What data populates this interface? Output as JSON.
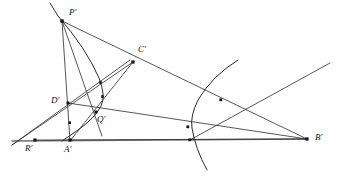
{
  "figure": {
    "canvas": {
      "width": 337,
      "height": 182
    },
    "colors": {
      "background": "#ffffff",
      "line": "#2b2b2b",
      "baseline": "#6e6e6e",
      "point": "#141414",
      "label": "#141414"
    }
  },
  "points": [
    {
      "id": "P",
      "label": "P′",
      "x": 62,
      "y": 21,
      "label_x": 69,
      "label_y": 8,
      "kind": "vertex"
    },
    {
      "id": "C",
      "label": "C′",
      "x": 133,
      "y": 62,
      "label_x": 138,
      "label_y": 45,
      "kind": "vertex"
    },
    {
      "id": "D",
      "label": "D′",
      "x": 68,
      "y": 103,
      "label_x": 51,
      "label_y": 96,
      "kind": "vertex"
    },
    {
      "id": "Q",
      "label": "Q′",
      "x": 96,
      "y": 112,
      "label_x": 97,
      "label_y": 115,
      "kind": "vertex"
    },
    {
      "id": "R",
      "label": "R′",
      "x": 35,
      "y": 140,
      "label_x": 25,
      "label_y": 144,
      "kind": "vertex"
    },
    {
      "id": "A",
      "label": "A′",
      "x": 70,
      "y": 140,
      "label_x": 64,
      "label_y": 145,
      "kind": "vertex"
    },
    {
      "id": "B",
      "label": "B′",
      "x": 307,
      "y": 139,
      "label_x": 315,
      "label_y": 133,
      "kind": "vertex"
    }
  ],
  "intersection_nodes": [
    {
      "id": "n1",
      "x": 101,
      "y": 83
    },
    {
      "id": "n2",
      "x": 103,
      "y": 97
    },
    {
      "id": "n3",
      "x": 70,
      "y": 123
    },
    {
      "id": "n4",
      "x": 221,
      "y": 100
    },
    {
      "id": "n5",
      "x": 188,
      "y": 127
    },
    {
      "id": "n6",
      "x": 190,
      "y": 140
    }
  ],
  "lines": [
    {
      "id": "baseline-R-B",
      "name": "baseline",
      "x1": 12,
      "y1": 141,
      "x2": 307,
      "y2": 139,
      "style": "baseline"
    },
    {
      "id": "line-P-A",
      "name": "P-to-A",
      "x1": 62,
      "y1": 21,
      "x2": 70,
      "y2": 141,
      "style": "line"
    },
    {
      "id": "line-P-C-B",
      "name": "P-through-C-to-B",
      "x1": 62,
      "y1": 21,
      "x2": 307,
      "y2": 139,
      "style": "line"
    },
    {
      "id": "line-P-Q-ext",
      "name": "P-through-Q",
      "x1": 62,
      "y1": 21,
      "x2": 102,
      "y2": 136,
      "style": "line"
    },
    {
      "id": "line-C-R",
      "name": "C-to-R-extended",
      "x1": 133,
      "y1": 62,
      "x2": 12,
      "y2": 145,
      "style": "line"
    },
    {
      "id": "line-C-A",
      "name": "C-to-A",
      "x1": 133,
      "y1": 62,
      "x2": 70,
      "y2": 141,
      "style": "line"
    },
    {
      "id": "line-D-B",
      "name": "D-to-B",
      "x1": 68,
      "y1": 103,
      "x2": 307,
      "y2": 139,
      "style": "line"
    },
    {
      "id": "line-R-D-up",
      "name": "R-through-D-upward",
      "x1": 12,
      "y1": 145,
      "x2": 130,
      "y2": 60,
      "style": "line"
    },
    {
      "id": "line-R-Q-B",
      "name": "R-through-Q-toward-B",
      "x1": 35,
      "y1": 140,
      "x2": 307,
      "y2": 139,
      "style": "line"
    },
    {
      "id": "line-A-Q-C",
      "name": "A-through-Q",
      "x1": 70,
      "y1": 141,
      "x2": 133,
      "y2": 62,
      "style": "line"
    },
    {
      "id": "line-rising-right",
      "name": "rising-line-to-right-edge",
      "x1": 190,
      "y1": 140,
      "x2": 330,
      "y2": 63,
      "style": "line"
    }
  ],
  "conic": {
    "name": "hyperbola",
    "left_branch": "M 50 3 L 58 16 Q 86 48 99 78 Q 106 96 101 106 Q 95 118 78 130 L 62 141",
    "right_branch": "M 238 60 Q 212 76 198 100 Q 190 116 192 128 Q 195 148 207 170"
  },
  "labels": {
    "P": "P′",
    "C": "C′",
    "D": "D′",
    "Q": "Q′",
    "R": "R′",
    "A": "A′",
    "B": "B′"
  }
}
